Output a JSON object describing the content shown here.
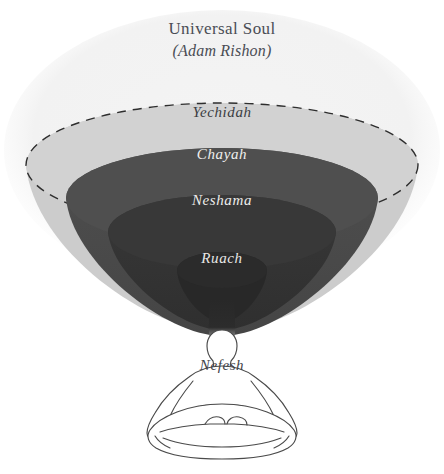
{
  "diagram": {
    "title": "Universal Soul",
    "subtitle": "(Adam Rishon)",
    "figure_label": "Nefesh",
    "layers": [
      {
        "id": "universal-soul",
        "name": "Universal Soul",
        "subtitle": "(Adam Rishon)",
        "color": "#f2f2f2",
        "border": "none"
      },
      {
        "id": "yechidah",
        "name": "Yechidah",
        "color": "#cccccc",
        "border": "dashed",
        "border_color": "#2e2e2e"
      },
      {
        "id": "chayah",
        "name": "Chayah",
        "color": "#4a4a4a",
        "border": "none"
      },
      {
        "id": "neshama",
        "name": "Neshama",
        "color": "#343434",
        "border": "none"
      },
      {
        "id": "ruach",
        "name": "Ruach",
        "color": "#282828",
        "border": "none"
      },
      {
        "id": "nefesh",
        "name": "Nefesh",
        "color": "#ffffff",
        "border": "solid",
        "border_color": "#4a4a4a"
      }
    ],
    "icons": {
      "figure": "meditating-person-icon"
    },
    "colors": {
      "background": "#ffffff",
      "universal_soul": "#f2f2f2",
      "yechidah": "#cccccc",
      "chayah": "#4a4a4a",
      "neshama": "#343434",
      "ruach": "#282828",
      "label_dark": "#3a3d42",
      "label_light": "#f0f0ee",
      "dash_stroke": "#2e2e2e",
      "figure_outline": "#4a4a4a"
    }
  }
}
